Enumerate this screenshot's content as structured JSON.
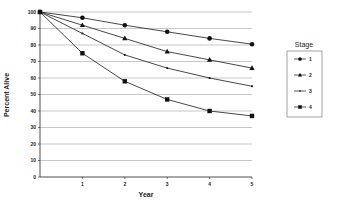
{
  "chart_data": {
    "type": "line",
    "title": "",
    "xlabel": "Year",
    "ylabel": "Percent Alive",
    "x": [
      0,
      1,
      2,
      3,
      4,
      5
    ],
    "x_tick_labels": [
      "1",
      "2",
      "3",
      "4",
      "5"
    ],
    "y_tick_labels": [
      "0",
      "10",
      "20",
      "30",
      "40",
      "50",
      "60",
      "70",
      "80",
      "90",
      "100"
    ],
    "ylim": [
      0,
      100
    ],
    "xlim": [
      0,
      5
    ],
    "grid": true,
    "legend_title": "Stage",
    "legend_position": "right",
    "series": [
      {
        "name": "1",
        "marker": "circle",
        "values": [
          100,
          96.5,
          92,
          88,
          84,
          80.5
        ]
      },
      {
        "name": "2",
        "marker": "triangle",
        "values": [
          100,
          92,
          84,
          76,
          71,
          66
        ]
      },
      {
        "name": "3",
        "marker": "dot",
        "values": [
          100,
          87,
          74,
          66,
          60,
          55
        ]
      },
      {
        "name": "4",
        "marker": "square",
        "values": [
          100,
          75,
          58,
          47,
          40,
          37
        ]
      }
    ]
  },
  "colors": {
    "line": "#333333",
    "grid": "#b0b0b0",
    "axis": "#222222"
  }
}
